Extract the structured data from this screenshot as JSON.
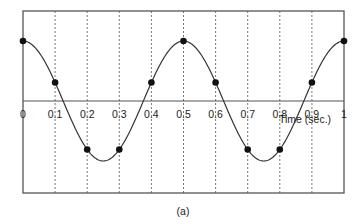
{
  "chart_data": {
    "type": "line",
    "title": "",
    "caption": "(a)",
    "xlabel": "Time (sec.)",
    "ylabel": "",
    "xlim": [
      0,
      1
    ],
    "ylim": [
      -1.55,
      1.55
    ],
    "x_ticks": [
      "0",
      "0.1",
      "0.2",
      "0.3",
      "0.4",
      "0.5",
      "0.6",
      "0.7",
      "0.8",
      "0.9",
      "1"
    ],
    "grid": "vertical dashed lines at each 0.1 s",
    "series": [
      {
        "name": "continuous signal cos(2π·2t)",
        "style": "solid curve",
        "frequency_hz": 2
      },
      {
        "name": "samples",
        "style": "filled dots",
        "x": [
          0,
          0.1,
          0.2,
          0.3,
          0.4,
          0.5,
          0.6,
          0.7,
          0.8,
          0.9,
          1.0
        ],
        "y": [
          1.0,
          0.309,
          -0.809,
          -0.809,
          0.309,
          1.0,
          0.309,
          -0.809,
          -0.809,
          0.309,
          1.0
        ]
      }
    ]
  },
  "colors": {
    "frame": "#555555",
    "curve": "#333333",
    "dots": "#111111",
    "grid": "#777777"
  }
}
